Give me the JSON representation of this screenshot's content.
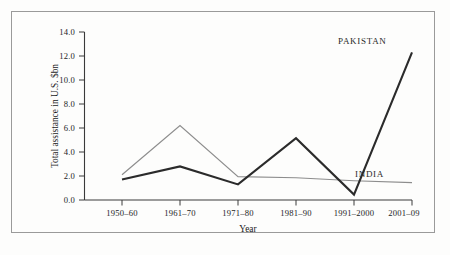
{
  "chart_data": {
    "type": "line",
    "title": "",
    "xlabel": "Year",
    "ylabel": "Total assistance in U.S. $bn",
    "categories": [
      "1950–60",
      "1961–70",
      "1971–80",
      "1981–90",
      "1991–2000",
      "2001–09"
    ],
    "ylim": [
      0.0,
      14.0
    ],
    "ytick_labels": [
      "0.0",
      "2.0",
      "4.0",
      "6.0",
      "8.0",
      "10.0",
      "12.0",
      "14.0"
    ],
    "ytick_values": [
      0.0,
      2.0,
      4.0,
      6.0,
      8.0,
      10.0,
      12.0,
      14.0
    ],
    "grid": false,
    "legend_position": "inline-annotation",
    "series": [
      {
        "name": "PAKISTAN",
        "color": "#2b2b2b",
        "values": [
          1.7,
          2.8,
          1.3,
          5.15,
          0.45,
          12.3
        ]
      },
      {
        "name": "INDIA",
        "color": "#8d8d8d",
        "values": [
          2.1,
          6.2,
          1.95,
          1.85,
          1.6,
          1.45
        ]
      }
    ],
    "annotations": [
      {
        "text": "PAKISTAN",
        "series": "PAKISTAN"
      },
      {
        "text": "INDIA",
        "series": "INDIA"
      }
    ]
  }
}
